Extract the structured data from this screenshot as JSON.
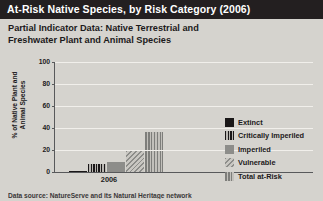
{
  "header": {
    "title": "At-Risk Native Species, by Risk Category (2006)",
    "bar_color": "#231f20",
    "text_color": "#ffffff"
  },
  "subtitle": "Partial Indicator Data: Native Terrestrial and Freshwater Plant and Animal Species",
  "footer": {
    "source": "Data source: NatureServe and its Natural Heritage network"
  },
  "axes": {
    "y_label": "% of Native Plant and Animal Species",
    "x_label": "2006",
    "y_ticks": [
      "100",
      "80",
      "60",
      "40",
      "20",
      "0"
    ]
  },
  "legend": {
    "items": [
      {
        "label": "Extinct",
        "swatch": "sw-extinct",
        "color": "#1a1718"
      },
      {
        "label": "Critically Imperiled",
        "swatch": "sw-crit",
        "color": "#1a1718"
      },
      {
        "label": "Imperiled",
        "swatch": "sw-imp",
        "color": "#8d8d8a"
      },
      {
        "label": "Vulnerable",
        "swatch": "sw-vuln",
        "color": "#b3b1ac"
      },
      {
        "label": "Total at-Risk",
        "swatch": "sw-total",
        "color": "#8d8d8a"
      }
    ]
  },
  "chart_data": {
    "type": "bar",
    "title": "At-Risk Native Species, by Risk Category (2006)",
    "subtitle": "Partial Indicator Data: Native Terrestrial and Freshwater Plant and Animal Species",
    "xlabel": "2006",
    "ylabel": "% of Native Plant and Animal Species",
    "ylim": [
      0,
      100
    ],
    "yticks": [
      0,
      20,
      40,
      60,
      80,
      100
    ],
    "grid": true,
    "legend_position": "right",
    "categories": [
      "Extinct",
      "Critically Imperiled",
      "Imperiled",
      "Vulnerable",
      "Total at-Risk"
    ],
    "values": [
      1,
      7,
      9,
      19,
      36
    ],
    "styles": [
      "sw-extinct",
      "sw-crit",
      "sw-imp",
      "sw-vuln",
      "sw-total"
    ],
    "annotation": "Data source: NatureServe and its Natural Heritage network"
  }
}
